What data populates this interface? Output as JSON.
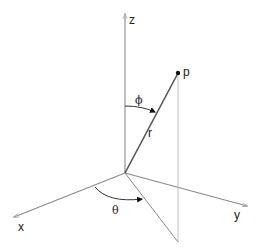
{
  "diagram": {
    "labels": {
      "z_axis": "z",
      "x_axis": "x",
      "y_axis": "y",
      "point": "p",
      "radius": "r",
      "polar_angle": "ϕ",
      "azimuth_angle": "θ"
    },
    "colors": {
      "axis": "#8a8a8a",
      "radius": "#555555",
      "guide": "#a0a0a0",
      "text": "#222222",
      "point": "#111111"
    }
  }
}
